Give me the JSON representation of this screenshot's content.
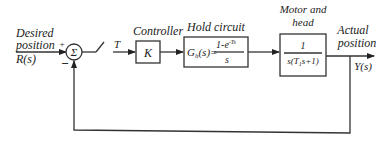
{
  "diagram": {
    "type": "control-block-diagram",
    "input": {
      "line1": "Desired",
      "line2": "position",
      "line3": "R(s)"
    },
    "summing_junction": {
      "symbol": "Σ",
      "plus_sign": "+",
      "minus_sign": "−"
    },
    "sampler": {
      "label": "T"
    },
    "controller": {
      "title": "Controller",
      "content": "K"
    },
    "hold_circuit": {
      "title": "Hold circuit",
      "lhs": "G",
      "lhs_sub": "h",
      "lhs_arg": "(s)=",
      "numerator": "1-e",
      "numerator_sup": "-Ts",
      "denominator": "s"
    },
    "plant": {
      "title_line1": "Motor and",
      "title_line2": "head",
      "numerator": "1",
      "denominator": "s(T",
      "denominator_sub": "1",
      "denominator_rest": "s+1)"
    },
    "output": {
      "line1": "Actual",
      "line2": "position",
      "line3": "Y(s)"
    }
  }
}
